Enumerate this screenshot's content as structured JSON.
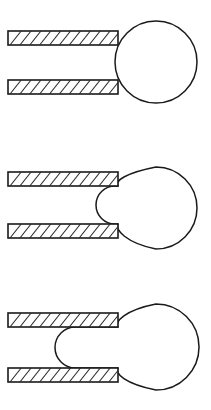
{
  "figure": {
    "canvas": {
      "width": 211,
      "height": 410,
      "background_color": "#ffffff"
    },
    "style": {
      "outline_color": "#1a1a1a",
      "hatch_color": "#2b2b2b",
      "fill_color": "#ffffff",
      "outline_width": 1.6,
      "hatch_width": 1.05
    }
  },
  "panels": [
    {
      "id": "panel-1",
      "label": "stage-1-undeformed",
      "stage_number": 1,
      "description": "Circle resting against the open ends of both bars, undeformed",
      "bars": [
        {
          "id": "panel-1-upper-bar",
          "position": "upper",
          "x": 8,
          "y": 31,
          "width": 110,
          "height": 14,
          "hatch_count": 10,
          "hatch_direction": "forward-slash"
        },
        {
          "id": "panel-1-lower-bar",
          "position": "lower",
          "x": 8,
          "y": 80,
          "width": 110,
          "height": 14,
          "hatch_count": 10,
          "hatch_direction": "forward-slash"
        }
      ],
      "body": {
        "id": "panel-1-circle",
        "shape": "circle",
        "center_x": 156,
        "center_y": 62,
        "radius": 41,
        "protrusion_tip_x": null,
        "deformation": "none"
      }
    },
    {
      "id": "panel-2",
      "label": "stage-2-partial-intrusion",
      "stage_number": 2,
      "description": "Circle pinched at the bar gap, bulging slightly inward between the plates",
      "bars": [
        {
          "id": "panel-2-upper-bar",
          "position": "upper",
          "x": 8,
          "y": 172,
          "width": 110,
          "height": 14,
          "hatch_count": 10,
          "hatch_direction": "forward-slash"
        },
        {
          "id": "panel-2-lower-bar",
          "position": "lower",
          "x": 8,
          "y": 224,
          "width": 110,
          "height": 14,
          "hatch_count": 10,
          "hatch_direction": "forward-slash"
        }
      ],
      "body": {
        "id": "panel-2-blob",
        "shape": "pinched-circle",
        "center_x": 156,
        "center_y": 208,
        "radius": 41,
        "protrusion_tip_x": 96,
        "deformation": "slight-intrusion"
      }
    },
    {
      "id": "panel-3",
      "label": "stage-3-extruded",
      "stage_number": 3,
      "description": "Body extruded through the gap, forming a rounded tongue reaching far left between the plates",
      "bars": [
        {
          "id": "panel-3-upper-bar",
          "position": "upper",
          "x": 8,
          "y": 313,
          "width": 110,
          "height": 14,
          "hatch_count": 10,
          "hatch_direction": "forward-slash"
        },
        {
          "id": "panel-3-lower-bar",
          "position": "lower",
          "x": 8,
          "y": 368,
          "width": 110,
          "height": 14,
          "hatch_count": 10,
          "hatch_direction": "forward-slash"
        }
      ],
      "body": {
        "id": "panel-3-blob",
        "shape": "extruded-circle",
        "center_x": 156,
        "center_y": 347,
        "radius": 43,
        "protrusion_tip_x": 55,
        "deformation": "full-extrusion"
      }
    }
  ]
}
